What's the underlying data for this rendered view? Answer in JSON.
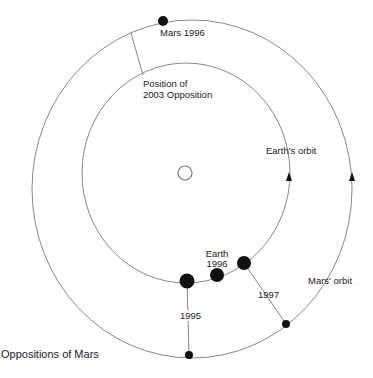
{
  "diagram": {
    "title": "Oppositions of Mars",
    "colors": {
      "orbit": "#888888",
      "body": "#111111",
      "text": "#222222"
    },
    "orbits": [
      {
        "name": "Earth's orbit",
        "label": "Earth's orbit"
      },
      {
        "name": "Mars' orbit",
        "label": "Mars' orbit"
      }
    ],
    "labels": {
      "mars_1996": "Mars 1996",
      "position_2003_line1": "Position of",
      "position_2003_line2": "2003 Opposition",
      "earth_orbit": "Earth's orbit",
      "mars_orbit": "Mars' orbit",
      "earth_1996_line1": "Earth",
      "earth_1996_line2": "1996",
      "year_1995": "1995",
      "year_1997": "1997"
    },
    "sun": {
      "label": "Sun"
    },
    "oppositions": [
      {
        "year": "1995",
        "earth": [
          187,
          281
        ],
        "mars": [
          189,
          355
        ]
      },
      {
        "year": "1996",
        "earth": [
          217,
          275
        ],
        "mars": [
          163,
          21
        ]
      },
      {
        "year": "1997",
        "earth": [
          244,
          263
        ],
        "mars": [
          286,
          324
        ]
      }
    ]
  }
}
